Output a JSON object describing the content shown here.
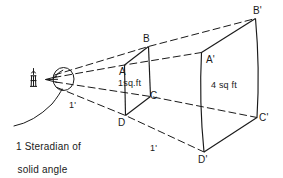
{
  "figure": {
    "title": "1 Steradian of solid angle",
    "caption_line1": "1 Steradian of",
    "caption_line2": "solid angle",
    "ink_color": "#1a1a1a",
    "background_color": "#ffffff"
  },
  "near_surface": {
    "area_label": "1sq.ft",
    "vertices": [
      {
        "name": "A",
        "label": "A"
      },
      {
        "name": "B",
        "label": "B"
      },
      {
        "name": "C",
        "label": "C"
      },
      {
        "name": "D",
        "label": "D"
      }
    ]
  },
  "far_surface": {
    "area_label": "4 sq ft",
    "vertices": [
      {
        "name": "A-prime",
        "label": "A'"
      },
      {
        "name": "B-prime",
        "label": "B'"
      },
      {
        "name": "C-prime",
        "label": "C'"
      },
      {
        "name": "D-prime",
        "label": "D'"
      }
    ]
  },
  "distances": [
    {
      "name": "radius-near",
      "label": "1'"
    },
    {
      "name": "radius-far",
      "label": "1'"
    }
  ],
  "icons": {
    "light_source": "candle-icon",
    "apex": "eye-icon"
  }
}
